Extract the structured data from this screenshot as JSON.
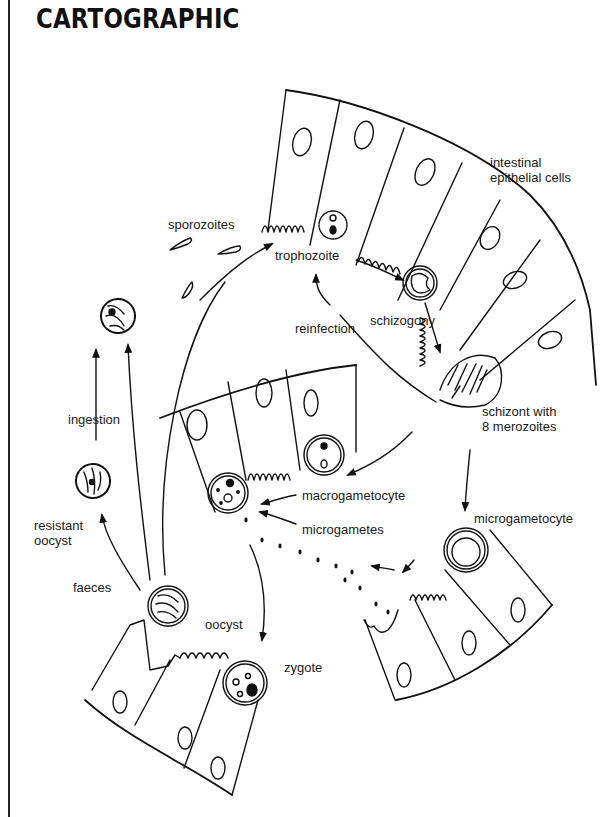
{
  "header": {
    "title": "CARTOGRAPHIC"
  },
  "diagram": {
    "labels": {
      "intestinal": "intestinal",
      "epithelial_cells": "epithelial cells",
      "sporozoites": "sporozoites",
      "trophozoite": "trophozoite",
      "reinfection": "reinfection",
      "schizogony": "schizogony",
      "schizont_line1": "schizont with",
      "schizont_line2": "8 merozoites",
      "ingestion": "ingestion",
      "resistant": "resistant",
      "oocyst_line": "oocyst",
      "macrogametocyte": "macrogametocyte",
      "microgametes": "microgametes",
      "microgametocyte": "microgametocyte",
      "faeces": "faeces",
      "oocyst": "oocyst",
      "zygote": "zygote"
    },
    "stages": [
      "sporozoites",
      "trophozoite",
      "schizogony",
      "schizont with 8 merozoites",
      "macrogametocyte",
      "microgametocyte",
      "microgametes",
      "zygote",
      "oocyst",
      "faeces",
      "resistant oocyst",
      "ingestion",
      "reinfection"
    ],
    "colors": {
      "ink": "#111111",
      "background": "#ffffff"
    }
  }
}
